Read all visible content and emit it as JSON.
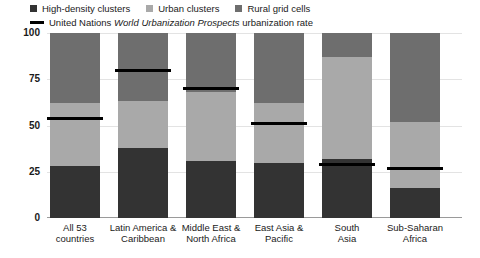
{
  "chart_data": {
    "type": "bar",
    "stacked": true,
    "title": "",
    "xlabel": "",
    "ylabel": "",
    "ylim": [
      0,
      100
    ],
    "yticks": [
      0,
      25,
      50,
      75,
      100
    ],
    "grid": true,
    "legend_position": "top-left",
    "categories": [
      "All 53 countries",
      "Latin America & Caribbean",
      "Middle East & North Africa",
      "East Asia & Pacific",
      "South Asia",
      "Sub-Saharan Africa"
    ],
    "series": [
      {
        "name": "High-density clusters",
        "color": "#333333",
        "values": [
          28,
          38,
          31,
          30,
          32,
          16
        ]
      },
      {
        "name": "Urban clusters",
        "color": "#a9a9a9",
        "values": [
          34,
          25,
          37,
          32,
          55,
          36
        ]
      },
      {
        "name": "Rural grid cells",
        "color": "#6e6e6e",
        "values": [
          38,
          37,
          32,
          38,
          13,
          48
        ]
      }
    ],
    "overlay_line": {
      "name": "United Nations World Urbanization Prospects urbanization rate",
      "color": "#000000",
      "values": [
        54,
        80,
        70,
        51,
        29,
        27
      ]
    }
  },
  "legend": {
    "items": [
      {
        "label": "High-density clusters",
        "color": "#333333",
        "swatch": "square-swatch"
      },
      {
        "label": "Urban clusters",
        "color": "#a9a9a9",
        "swatch": "square-swatch"
      },
      {
        "label": "Rural grid cells",
        "color": "#6e6e6e",
        "swatch": "square-swatch"
      }
    ],
    "line_entry": {
      "prefix": "United Nations ",
      "italic": "World Urbanization Prospects",
      "suffix": " urbanization rate",
      "color": "#000000",
      "swatch": "line-swatch"
    }
  },
  "axis": {
    "yticks": [
      "100",
      "75",
      "50",
      "25",
      "0"
    ]
  },
  "xlabels": [
    {
      "line1": "All 53",
      "line2": "countries"
    },
    {
      "line1": "Latin America &",
      "line2": "Caribbean"
    },
    {
      "line1": "Middle East &",
      "line2": "North Africa"
    },
    {
      "line1": "East Asia &",
      "line2": "Pacific"
    },
    {
      "line1": "South",
      "line2": "Asia"
    },
    {
      "line1": "Sub-Saharan",
      "line2": "Africa"
    }
  ]
}
